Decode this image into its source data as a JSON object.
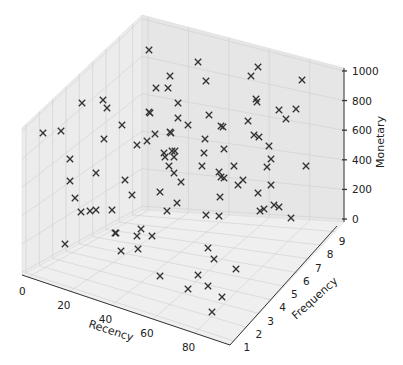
{
  "chart_data": {
    "type": "scatter",
    "projection": "3d",
    "title": "",
    "xlabel": "Recency",
    "ylabel": "Frequency",
    "zlabel": "Monetary",
    "xlim": [
      0,
      100
    ],
    "ylim": [
      1,
      9
    ],
    "zlim": [
      0,
      1000
    ],
    "x_ticks": [
      "0",
      "20",
      "40",
      "60",
      "80"
    ],
    "y_ticks": [
      "1",
      "2",
      "3",
      "4",
      "5",
      "6",
      "7",
      "8",
      "9"
    ],
    "z_ticks": [
      "0",
      "200",
      "400",
      "600",
      "800",
      "1000"
    ],
    "marker": "x",
    "marker_color": "#333333",
    "grid": true,
    "pane_color": "#ececec",
    "points_screen": [
      [
        149,
        50
      ],
      [
        198,
        62
      ],
      [
        170,
        76
      ],
      [
        168,
        88
      ],
      [
        156,
        88
      ],
      [
        206,
        81
      ],
      [
        258,
        67
      ],
      [
        251,
        76
      ],
      [
        302,
        80
      ],
      [
        82,
        103
      ],
      [
        103,
        100
      ],
      [
        107,
        108
      ],
      [
        178,
        103
      ],
      [
        256,
        99
      ],
      [
        257,
        102
      ],
      [
        279,
        110
      ],
      [
        296,
        109
      ],
      [
        149,
        112
      ],
      [
        150,
        113
      ],
      [
        178,
        118
      ],
      [
        209,
        115
      ],
      [
        286,
        119
      ],
      [
        43,
        133
      ],
      [
        61,
        131
      ],
      [
        122,
        125
      ],
      [
        155,
        134
      ],
      [
        170,
        132
      ],
      [
        171,
        133
      ],
      [
        188,
        125
      ],
      [
        223,
        127
      ],
      [
        248,
        121
      ],
      [
        221,
        126
      ],
      [
        104,
        139
      ],
      [
        137,
        145
      ],
      [
        147,
        141
      ],
      [
        205,
        139
      ],
      [
        254,
        135
      ],
      [
        259,
        137
      ],
      [
        269,
        146
      ],
      [
        70,
        159
      ],
      [
        164,
        153
      ],
      [
        172,
        151
      ],
      [
        175,
        151
      ],
      [
        165,
        157
      ],
      [
        174,
        157
      ],
      [
        204,
        153
      ],
      [
        224,
        149
      ],
      [
        271,
        159
      ],
      [
        96,
        173
      ],
      [
        169,
        166
      ],
      [
        174,
        173
      ],
      [
        202,
        166
      ],
      [
        234,
        166
      ],
      [
        219,
        172
      ],
      [
        221,
        177
      ],
      [
        224,
        178
      ],
      [
        243,
        180
      ],
      [
        238,
        185
      ],
      [
        267,
        167
      ],
      [
        306,
        166
      ],
      [
        125,
        180
      ],
      [
        181,
        182
      ],
      [
        70,
        181
      ],
      [
        160,
        192
      ],
      [
        132,
        195
      ],
      [
        220,
        197
      ],
      [
        258,
        193
      ],
      [
        271,
        185
      ],
      [
        75,
        198
      ],
      [
        81,
        212
      ],
      [
        90,
        211
      ],
      [
        96,
        210
      ],
      [
        112,
        210
      ],
      [
        167,
        211
      ],
      [
        177,
        203
      ],
      [
        206,
        215
      ],
      [
        219,
        216
      ],
      [
        260,
        211
      ],
      [
        264,
        209
      ],
      [
        274,
        205
      ],
      [
        279,
        207
      ],
      [
        291,
        218
      ],
      [
        115,
        233
      ],
      [
        116,
        233
      ],
      [
        137,
        236
      ],
      [
        141,
        229
      ],
      [
        152,
        236
      ],
      [
        65,
        244
      ],
      [
        121,
        251
      ],
      [
        138,
        249
      ],
      [
        208,
        248
      ],
      [
        214,
        259
      ],
      [
        236,
        269
      ],
      [
        160,
        276
      ],
      [
        198,
        275
      ],
      [
        208,
        286
      ],
      [
        188,
        289
      ],
      [
        222,
        297
      ],
      [
        212,
        312
      ]
    ]
  },
  "figure": {
    "width": 403,
    "height": 365,
    "background": "#ffffff"
  }
}
